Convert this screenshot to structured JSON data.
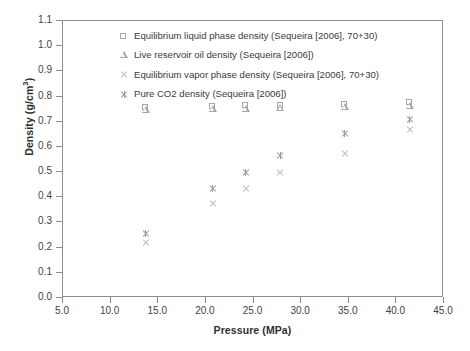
{
  "chart_data": {
    "type": "scatter",
    "title": "",
    "xlabel": "Pressure (MPa)",
    "ylabel": "Density (g/cm3)",
    "ylabel_display": "Density (g/cm",
    "ylabel_sup": "3",
    "ylabel_tail": ")",
    "xlim": [
      5.0,
      45.0
    ],
    "ylim": [
      0.0,
      1.1
    ],
    "xticks": [
      "5.0",
      "10.0",
      "15.0",
      "20.0",
      "25.0",
      "30.0",
      "35.0",
      "40.0",
      "45.0"
    ],
    "xtick_values": [
      5.0,
      10.0,
      15.0,
      20.0,
      25.0,
      30.0,
      35.0,
      40.0,
      45.0
    ],
    "yticks": [
      "0.0",
      "0.1",
      "0.2",
      "0.3",
      "0.4",
      "0.5",
      "0.6",
      "0.7",
      "0.8",
      "0.9",
      "1.0",
      "1.1"
    ],
    "ytick_values": [
      0.0,
      0.1,
      0.2,
      0.3,
      0.4,
      0.5,
      0.6,
      0.7,
      0.8,
      0.9,
      1.0,
      1.1
    ],
    "grid": false,
    "legend_position": "upper-center-inside",
    "marker_color_open": "#a8a8a8",
    "marker_color_x": "#bdbdbd",
    "marker_color_star": "#9a9a9a",
    "series": [
      {
        "name": "Equilibrium liquid phase density (Sequeira [2006], 70+30)",
        "marker": "open-square",
        "x": [
          13.7,
          20.7,
          24.2,
          27.8,
          34.6,
          41.4
        ],
        "y": [
          0.757,
          0.762,
          0.763,
          0.765,
          0.77,
          0.775
        ]
      },
      {
        "name": "Live reservoir oil density (Sequeira [2006])",
        "marker": "open-triangle",
        "x": [
          13.7,
          20.7,
          24.2,
          27.8,
          34.6,
          41.4
        ],
        "y": [
          0.747,
          0.75,
          0.752,
          0.754,
          0.76,
          0.764
        ]
      },
      {
        "name": "Equilibrium vapor phase density (Sequeira [2006], 70+30)",
        "marker": "x-cross",
        "x": [
          13.7,
          20.7,
          24.2,
          27.8,
          34.6,
          41.4
        ],
        "y": [
          0.22,
          0.374,
          0.434,
          0.497,
          0.572,
          0.671
        ]
      },
      {
        "name": "Pure CO2 density (Sequeira [2006])",
        "marker": "bold-star",
        "x": [
          13.7,
          20.7,
          24.2,
          27.8,
          34.6,
          41.4
        ],
        "y": [
          0.258,
          0.434,
          0.5,
          0.564,
          0.655,
          0.707
        ]
      }
    ]
  },
  "legend": {
    "items": [
      {
        "label": "Equilibrium liquid phase density (Sequeira [2006], 70+30)",
        "marker": "open-square"
      },
      {
        "label": "Live reservoir oil density (Sequeira [2006])",
        "marker": "open-triangle"
      },
      {
        "label": "Equilibrium vapor phase density (Sequeira [2006], 70+30)",
        "marker": "x-cross"
      },
      {
        "label": "Pure CO2 density (Sequeira [2006])",
        "marker": "bold-star"
      }
    ]
  }
}
